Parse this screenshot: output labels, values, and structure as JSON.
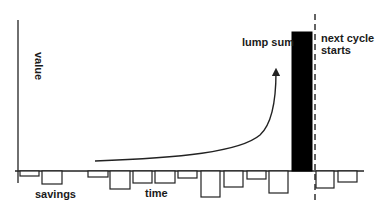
{
  "diagram": {
    "labels": {
      "y_axis": "value",
      "savings": "savings",
      "time": "time",
      "lump_sum": "lump sum",
      "next_cycle_line1": "next cycle",
      "next_cycle_line2": "starts"
    },
    "colors": {
      "stroke": "#222222",
      "lump_fill": "#000000",
      "background": "#ffffff"
    },
    "baseline_y": 171,
    "savings_bars": [
      {
        "x": 20,
        "w": 19,
        "depth": 5
      },
      {
        "x": 42,
        "w": 20,
        "depth": 13
      },
      {
        "x": 88,
        "w": 20,
        "depth": 6
      },
      {
        "x": 110,
        "w": 20,
        "depth": 18
      },
      {
        "x": 133,
        "w": 19,
        "depth": 12
      },
      {
        "x": 155,
        "w": 20,
        "depth": 12
      },
      {
        "x": 178,
        "w": 19,
        "depth": 7
      },
      {
        "x": 201,
        "w": 19,
        "depth": 26
      },
      {
        "x": 224,
        "w": 19,
        "depth": 16
      },
      {
        "x": 247,
        "w": 19,
        "depth": 8
      },
      {
        "x": 269,
        "w": 19,
        "depth": 22
      },
      {
        "x": 316,
        "w": 18,
        "depth": 17
      },
      {
        "x": 338,
        "w": 19,
        "depth": 11
      }
    ],
    "lump_bar": {
      "x": 292,
      "y": 32,
      "w": 20,
      "h": 139
    },
    "cycle_line_x": 315
  }
}
